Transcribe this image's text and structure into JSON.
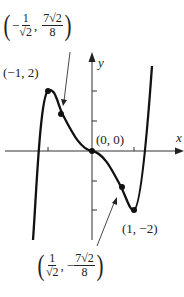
{
  "graph": {
    "axis_x_label": "x",
    "axis_y_label": "y",
    "curve_color": "#111111",
    "points": [
      {
        "label": "(−1, 2)",
        "x": -1,
        "y": 2,
        "type": "relative-max"
      },
      {
        "label": "(0, 0)",
        "x": 0,
        "y": 0,
        "type": "inflection"
      },
      {
        "label": "(1, −2)",
        "x": 1,
        "y": -2,
        "type": "relative-min"
      }
    ],
    "inflection_left": {
      "x_num": "1",
      "x_den": "√2",
      "x_sign": "−",
      "y_num": "7√2",
      "y_den": "8",
      "y_sign": ""
    },
    "inflection_right": {
      "x_num": "1",
      "x_den": "√2",
      "x_sign": "",
      "y_num": "7√2",
      "y_den": "8",
      "y_sign": "−"
    }
  },
  "text": {
    "label_max": "(−1, 2)",
    "label_origin": "(0, 0)",
    "label_min": "(1, −2)",
    "x": "x",
    "y": "y",
    "comma": ",",
    "lparen": "(",
    "rparen": ")",
    "minus": "−",
    "one": "1",
    "root2": "√2",
    "sevenroot2": "7√2",
    "eight": "8"
  }
}
